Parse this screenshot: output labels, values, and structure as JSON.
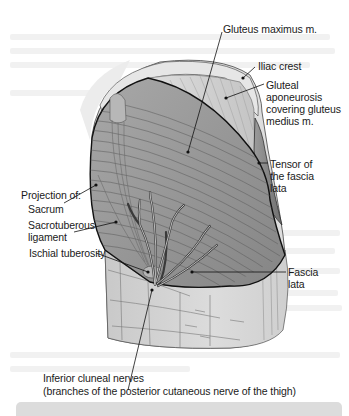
{
  "figure": {
    "colors": {
      "muscle": "#9a9a9a",
      "muscle_dark": "#7e7e7e",
      "aponeurosis": "#cfcfcf",
      "fascia": "#d9d9d9",
      "outline": "#111111",
      "leader": "#111111",
      "caption_bar": "#dcdcdc"
    },
    "labels": {
      "gluteus_maximus": "Gluteus maximus m.",
      "iliac_crest": "Iliac crest",
      "gluteal_aponeurosis": "Gluteal\naponeurosis\ncovering gluteus\nmedius m.",
      "tensor_fascia_lata": "Tensor of\nthe fascia\nlata",
      "projection_of": "Projection of:",
      "sacrum": "Sacrum",
      "sacrotuberous": "Sacrotuberous\nligament",
      "ischial_tuberosity": "Ischial tuberosity",
      "fascia_lata": "Fascia\nlata",
      "inferior_cluneal": "Inferior cluneal nerves",
      "inferior_cluneal_note": "(branches of the posterior cutaneous nerve of the thigh)"
    }
  }
}
